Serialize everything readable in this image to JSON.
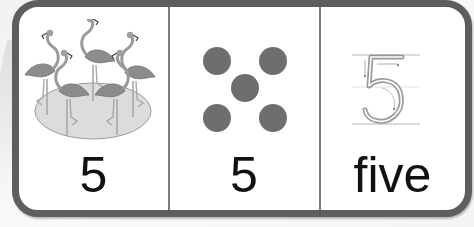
{
  "card": {
    "panels": [
      {
        "id": "picture",
        "image": "flamingos-in-pond",
        "count": 5,
        "label": "5"
      },
      {
        "id": "dots",
        "image": "five-dots-dice-pattern",
        "count": 5,
        "label": "5"
      },
      {
        "id": "tracing",
        "image": "numeral-5-tracing-guide",
        "traced_numeral": "5",
        "label": "five"
      }
    ]
  },
  "colors": {
    "frame": "#5e5e5e",
    "divider": "#7a7a7a",
    "dot": "#6e6e6e",
    "flamingo": "#8a8a8a",
    "pond": "#d9d9d9",
    "text": "#111111"
  }
}
